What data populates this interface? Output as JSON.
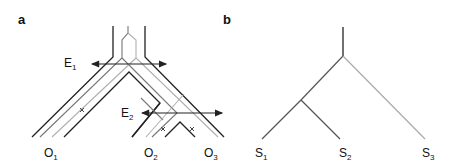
{
  "panel_a": {
    "label": "a",
    "events": [
      {
        "base": "E",
        "sub": "1"
      },
      {
        "base": "E",
        "sub": "2"
      }
    ],
    "tips": [
      {
        "base": "O",
        "sub": "1"
      },
      {
        "base": "O",
        "sub": "2"
      },
      {
        "base": "O",
        "sub": "3"
      }
    ]
  },
  "panel_b": {
    "label": "b",
    "tips": [
      {
        "base": "S",
        "sub": "1"
      },
      {
        "base": "S",
        "sub": "2"
      },
      {
        "base": "S",
        "sub": "3"
      }
    ]
  },
  "colors": {
    "dark": "#222222",
    "mid": "#777777",
    "light": "#b0b0b0"
  }
}
